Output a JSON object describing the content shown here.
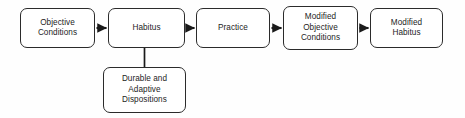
{
  "diagram": {
    "canvas": {
      "width": 465,
      "height": 118,
      "background": "#fefefe"
    },
    "style": {
      "node_fill": "#ffffff",
      "node_border": "#2b2b2b",
      "text_color": "#1d1d1d",
      "arrow_color": "#1a1a1a"
    },
    "nodes": [
      {
        "id": "objective-conditions",
        "label": "Objective\nConditions",
        "x": 20,
        "y": 8,
        "w": 75,
        "h": 40
      },
      {
        "id": "habitus",
        "label": "Habitus",
        "x": 108,
        "y": 8,
        "w": 77,
        "h": 40
      },
      {
        "id": "practice",
        "label": "Practice",
        "x": 196,
        "y": 8,
        "w": 74,
        "h": 40
      },
      {
        "id": "modified-objective-conditions",
        "label": "Modified\nObjective\nConditions",
        "x": 283,
        "y": 6,
        "w": 75,
        "h": 44
      },
      {
        "id": "modified-habitus",
        "label": "Modified\nHabitus",
        "x": 370,
        "y": 8,
        "w": 73,
        "h": 40
      },
      {
        "id": "durable-adaptive-dispositions",
        "label": "Durable and\nAdaptive\nDispositions",
        "x": 103,
        "y": 67,
        "w": 83,
        "h": 46
      }
    ],
    "edges": [
      {
        "id": "objective-conditions-to-habitus",
        "from": "objective-conditions",
        "to": "habitus",
        "kind": "arrow",
        "orientation": "horizontal"
      },
      {
        "id": "habitus-to-practice",
        "from": "habitus",
        "to": "practice",
        "kind": "arrow",
        "orientation": "horizontal"
      },
      {
        "id": "practice-to-modified-objective-conditions",
        "from": "practice",
        "to": "modified-objective-conditions",
        "kind": "arrow",
        "orientation": "horizontal"
      },
      {
        "id": "modified-objective-conditions-to-modified-habitus",
        "from": "modified-objective-conditions",
        "to": "modified-habitus",
        "kind": "arrow",
        "orientation": "horizontal"
      },
      {
        "id": "habitus-to-durable-adaptive-dispositions",
        "from": "habitus",
        "to": "durable-adaptive-dispositions",
        "kind": "line",
        "orientation": "vertical"
      }
    ]
  }
}
